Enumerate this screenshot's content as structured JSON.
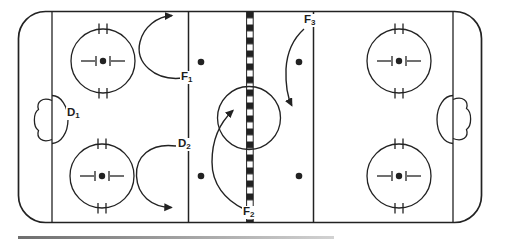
{
  "labels": {
    "d1": {
      "main": "D",
      "sub": "1"
    },
    "d2": {
      "main": "D",
      "sub": "2"
    },
    "f1": {
      "main": "F",
      "sub": "1"
    },
    "f2": {
      "main": "F",
      "sub": "2"
    },
    "f3": {
      "main": "F",
      "sub": "3"
    }
  },
  "colors": {
    "ink": "#222222",
    "background": "#ffffff",
    "underline_gradient_start": "#6e6e6e",
    "underline_gradient_end": "#d2d2d2"
  }
}
